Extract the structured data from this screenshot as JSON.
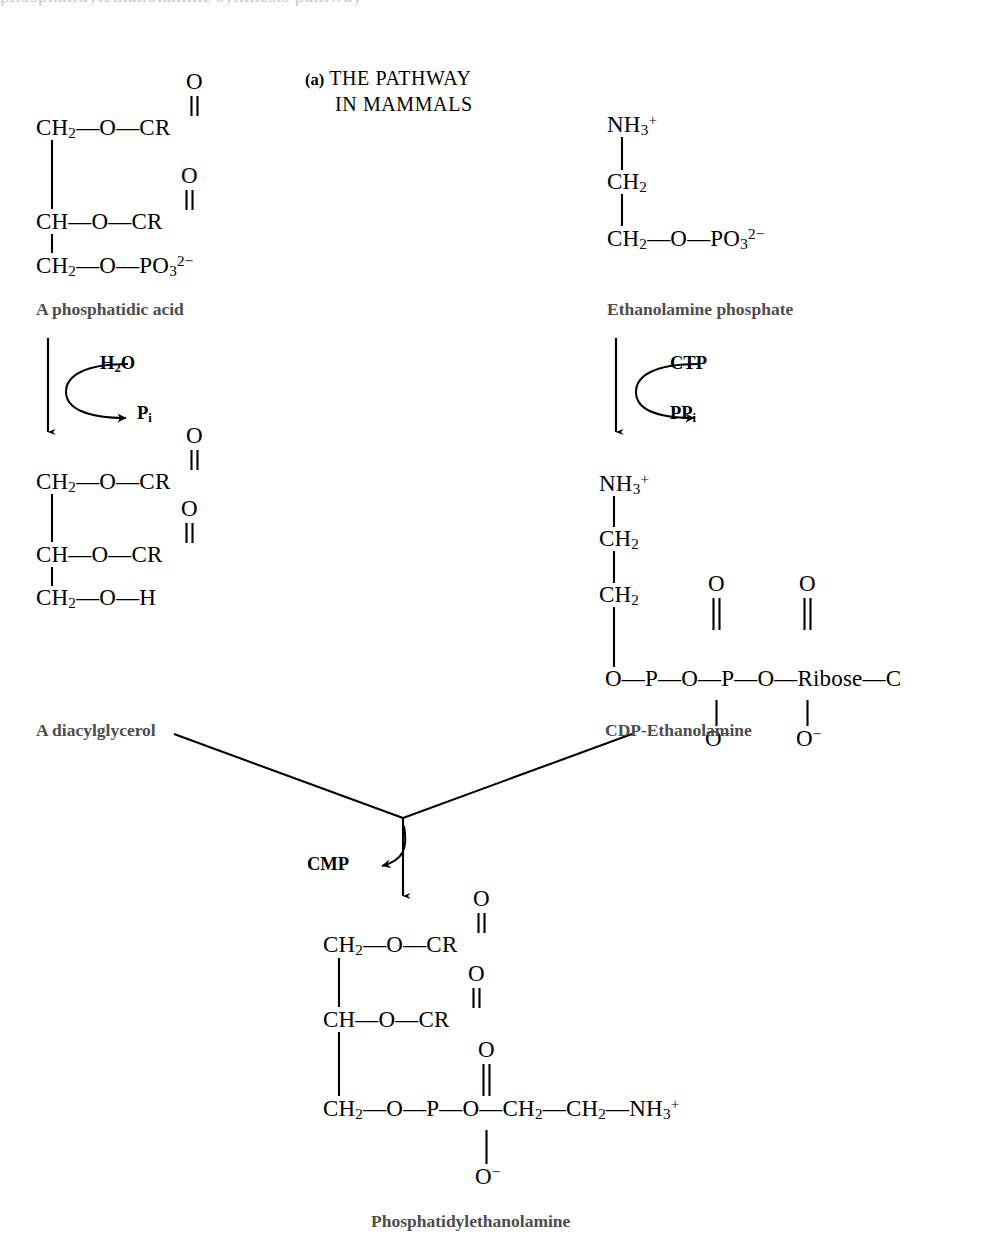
{
  "figure": {
    "panel_tag": "(a)",
    "title_line1": "THE PATHWAY",
    "title_line2": "IN MAMMALS",
    "ink_color": "#000000",
    "label_color": "#4d4d4d",
    "background": "#ffffff",
    "type": "biochemical-pathway-diagram"
  },
  "compounds": {
    "phosphatidic_acid": {
      "name": "A phosphatidic acid",
      "rows": [
        {
          "backbone": "CH",
          "backbone_sub": "2",
          "linker": "—O—",
          "group": "CR",
          "carbonyl": "O",
          "carbonyl_double_bond": true
        },
        {
          "backbone": "CH",
          "backbone_sub": "",
          "linker": "—O—",
          "group": "CR",
          "carbonyl": "O",
          "carbonyl_double_bond": true
        },
        {
          "backbone": "CH",
          "backbone_sub": "2",
          "linker": "—O—",
          "group": "PO",
          "group_sub": "3",
          "group_sup": "2−",
          "carbonyl": "",
          "carbonyl_double_bond": false
        }
      ]
    },
    "ethanolamine_phosphate": {
      "name": "Ethanolamine phosphate",
      "rows": [
        {
          "text": "NH",
          "sub": "3",
          "sup": "+"
        },
        {
          "text": "CH",
          "sub": "2",
          "sup": ""
        },
        {
          "text": "CH",
          "sub": "2",
          "sup": "",
          "tail": "—O—PO",
          "tail_sub": "3",
          "tail_sup": "2−"
        }
      ]
    },
    "diacylglycerol": {
      "name": "A diacylglycerol",
      "rows": [
        {
          "backbone": "CH",
          "backbone_sub": "2",
          "linker": "—O—",
          "group": "CR",
          "carbonyl": "O"
        },
        {
          "backbone": "CH",
          "backbone_sub": "",
          "linker": "—O—",
          "group": "CR",
          "carbonyl": "O"
        },
        {
          "backbone": "CH",
          "backbone_sub": "2",
          "linker": "—O—",
          "group": "H",
          "carbonyl": ""
        }
      ]
    },
    "cdp_ethanolamine": {
      "name": "CDP-Ethanolamine",
      "rows": [
        {
          "text": "NH",
          "sub": "3",
          "sup": "+"
        },
        {
          "text": "CH",
          "sub": "2",
          "sup": ""
        },
        {
          "text": "CH",
          "sub": "2",
          "sup": ""
        }
      ],
      "diphosphate_chain": [
        "O",
        "—",
        "P",
        "—",
        "O",
        "—",
        "P",
        "—",
        "O",
        "—",
        "Ribose",
        "—",
        "C"
      ],
      "p1_top_oxygen": "O",
      "p1_bottom_oxygen": "O",
      "p1_bottom_charge": "−",
      "p2_top_oxygen": "O",
      "p2_bottom_oxygen": "O",
      "p2_bottom_charge": "−",
      "ribose_label": "Ribose",
      "terminal_label": "C"
    },
    "phosphatidylethanolamine": {
      "name": "Phosphatidylethanolamine",
      "rows": [
        {
          "backbone": "CH",
          "backbone_sub": "2",
          "linker": "—O—",
          "group": "CR",
          "carbonyl": "O"
        },
        {
          "backbone": "CH",
          "backbone_sub": "",
          "linker": "—O—",
          "group": "CR",
          "carbonyl": "O"
        }
      ],
      "head_group": {
        "backbone": "CH",
        "backbone_sub": "2",
        "chain": "—O—",
        "phosphorus": "P",
        "top_oxygen": "O",
        "bottom_oxygen": "O",
        "bottom_charge": "−",
        "tail": "—O—CH",
        "tail_sub1": "2",
        "tail_mid": "—CH",
        "tail_sub2": "2",
        "tail_end": "—NH",
        "tail_sub3": "3",
        "tail_sup": "+"
      }
    }
  },
  "reactions": [
    {
      "id": "hydrolysis",
      "substrate_in": "H₂O",
      "reactant_label": "H",
      "reactant_sub": "2",
      "reactant_tail": "O",
      "product_label": "P",
      "product_sub": "i"
    },
    {
      "id": "cytidylyltransfer",
      "reactant_label": "CTP",
      "product_label": "PP",
      "product_sub": "i"
    },
    {
      "id": "condensation",
      "product_label": "CMP"
    }
  ],
  "clipped_top_text": "occasional descenders of clipped line above"
}
